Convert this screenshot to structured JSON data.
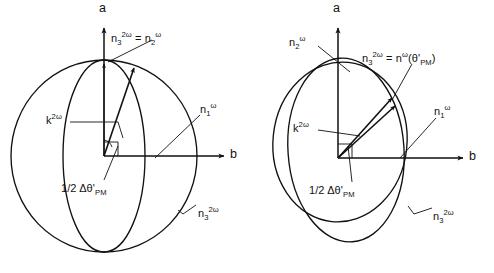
{
  "figure": {
    "stroke_color": "#111111",
    "background_color": "#ffffff"
  },
  "panels": [
    {
      "id": "left-panel",
      "name": "sphere-panel",
      "axes": {
        "vertical_label": "a",
        "horizontal_label": "b"
      },
      "curves": [
        {
          "name": "outer-sphere-circle",
          "type": "circle"
        },
        {
          "name": "inner-meridian-ellipse",
          "type": "ellipse"
        }
      ],
      "vectors": [
        {
          "name": "k-vector-vertical",
          "label": "k2w"
        },
        {
          "name": "index-vector-tilted",
          "label": ""
        }
      ],
      "labels": {
        "top_relation": "n3^2w = n2^w",
        "k_vector": "k^2w",
        "angle": "1/2 Δθ'PM",
        "n1": "n1^w",
        "n3": "n3^2w"
      }
    },
    {
      "id": "right-panel",
      "name": "ellipse-panel",
      "axes": {
        "vertical_label": "a",
        "horizontal_label": "b"
      },
      "curves": [
        {
          "name": "tall-ellipse",
          "type": "ellipse"
        },
        {
          "name": "wide-ellipse",
          "type": "ellipse"
        }
      ],
      "vectors": [
        {
          "name": "k-vector-tilted",
          "label": "k2w"
        },
        {
          "name": "index-vector-tilted",
          "label": ""
        }
      ],
      "labels": {
        "n2": "n2^w",
        "top_relation": "n3^2w = n^w(θ'PM)",
        "k_vector": "k^2w",
        "angle": "1/2 Δθ'PM",
        "n1": "n1^w",
        "n3": "n3^2w"
      }
    }
  ],
  "text": {
    "axis_a": "a",
    "axis_b": "b",
    "n_sub3": "n",
    "sub_3": "3",
    "sup_2w": "2ω",
    "sup_w": "ω",
    "equals": "=",
    "sub_2": "2",
    "sub_1": "1",
    "k_letter": "k",
    "half": "1/2",
    "delta_theta": "Δθ'",
    "sub_pm": "PM",
    "theta_prime_pm": "(θ'",
    "paren_close": ")"
  }
}
